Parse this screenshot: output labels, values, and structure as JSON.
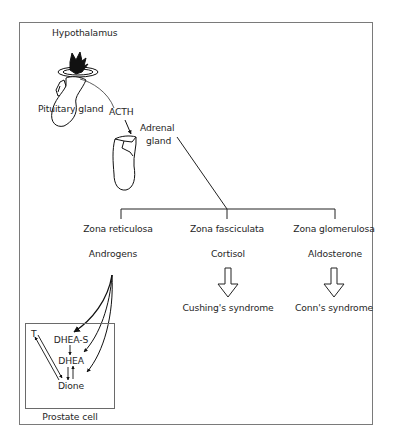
{
  "diagram": {
    "hypothalamus_label": "Hypothalamus",
    "pituitary_label": "Pituitary gland",
    "hormone_label": "ACTH",
    "adrenal_label_line1": "Adrenal",
    "adrenal_label_line2": "gland",
    "zones": [
      {
        "name": "Zona reticulosa",
        "product": "Androgens",
        "outcome": null
      },
      {
        "name": "Zona fasciculata",
        "product": "Cortisol",
        "outcome": "Cushing's syndrome"
      },
      {
        "name": "Zona glomerulosa",
        "product": "Aldosterone",
        "outcome": "Conn's syndrome"
      }
    ],
    "prostate": {
      "label": "Prostate cell",
      "metabolites": {
        "t": "T",
        "dhea_s": "DHEA-S",
        "dhea": "DHEA",
        "dione": "Dione"
      }
    },
    "colors": {
      "frame": "#7a7a7a",
      "line": "#222222",
      "text": "#262626"
    }
  }
}
